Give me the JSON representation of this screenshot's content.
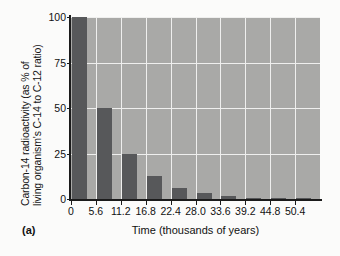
{
  "figure": {
    "panel_label": "(a)",
    "background_color": "#fbfbfa",
    "plot_background_color": "#a9a9a7",
    "bar_color": "#57585a",
    "grid_color": "#efefee",
    "axis_color": "#1b1b1b"
  },
  "chart_data": {
    "type": "bar",
    "title": "",
    "subtitle": "",
    "xlabel": "Time (thousands of years)",
    "ylabel": "Carbon-14 radioactivity (as % of living organism's C-14 to C-12 ratio)",
    "ylabel_line1": "Carbon-14 radioactivity (as % of",
    "ylabel_line2": "living organism's C-14 to C-12 ratio)",
    "categories": [
      "0",
      "5.6",
      "11.2",
      "16.8",
      "22.4",
      "28.0",
      "33.6",
      "39.2",
      "44.8",
      "50.4"
    ],
    "x": [
      0,
      5.6,
      11.2,
      16.8,
      22.4,
      28.0,
      33.6,
      39.2,
      44.8,
      50.4
    ],
    "values": [
      100,
      50,
      25,
      12.5,
      6.25,
      3.125,
      1.5625,
      0.78,
      0.39,
      0.2
    ],
    "ylim": [
      0,
      100
    ],
    "xlim": [
      0,
      56
    ],
    "yticks": [
      0,
      25,
      50,
      75,
      100
    ],
    "ytick_labels": [
      "0",
      "25",
      "50",
      "75",
      "100"
    ],
    "xtick_labels": [
      "0",
      "5.6",
      "11.2",
      "16.8",
      "22.4",
      "28.0",
      "33.6",
      "39.2",
      "44.8",
      "50.4"
    ],
    "grid": true,
    "grid_orientation": "both",
    "legend": null,
    "legend_position": "none",
    "annotations": [
      "(a)"
    ],
    "series": [
      {
        "name": "Carbon-14 remaining",
        "values": [
          100,
          50,
          25,
          12.5,
          6.25,
          3.125,
          1.5625,
          0.78,
          0.39,
          0.2
        ]
      }
    ]
  }
}
